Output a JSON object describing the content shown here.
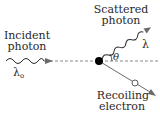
{
  "labels": {
    "incident_line1": "Incident",
    "incident_line2": "photon",
    "incident_wavelength": "λ",
    "incident_wavelength_sub": "o",
    "scattered_line1": "Scattered",
    "scattered_line2": "photon",
    "scattered_wavelength": "λ",
    "angle": "θ",
    "recoil_line1": "Recoiling",
    "recoil_line2": "electron"
  },
  "colors": {
    "ink": "#2a2a2a",
    "arrow": "#6a6a6a",
    "dashed": "#8a8a8a",
    "electron": "#000000"
  }
}
